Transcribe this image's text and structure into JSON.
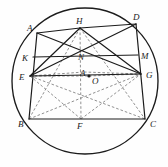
{
  "figure": {
    "type": "euclidean-geometry-diagram",
    "colors": {
      "stroke": "#1b1b1b",
      "dashed": "#7a7a7a",
      "background": "#fefefe",
      "label": "#1b1b1b"
    },
    "circle": {
      "name": "circumcircle",
      "cx": 85,
      "cy": 81,
      "r": 73
    },
    "points": [
      {
        "id": "A",
        "label": "A",
        "x": 37,
        "y": 33,
        "lx": 27,
        "ly": 31
      },
      {
        "id": "B",
        "label": "B",
        "x": 29,
        "y": 119,
        "lx": 18,
        "ly": 127
      },
      {
        "id": "C",
        "label": "C",
        "x": 145,
        "y": 119,
        "lx": 150,
        "ly": 127
      },
      {
        "id": "D",
        "label": "D",
        "x": 136,
        "y": 24,
        "lx": 133,
        "ly": 20
      },
      {
        "id": "E",
        "label": "E",
        "x": 30,
        "y": 76,
        "lx": 19,
        "ly": 80
      },
      {
        "id": "F",
        "label": "F",
        "x": 81,
        "y": 119,
        "lx": 77,
        "ly": 129
      },
      {
        "id": "G",
        "label": "G",
        "x": 141,
        "y": 74,
        "lx": 146,
        "ly": 78
      },
      {
        "id": "H",
        "label": "H",
        "x": 80,
        "y": 28,
        "lx": 76,
        "ly": 24
      },
      {
        "id": "K",
        "label": "K",
        "x": 33,
        "y": 57,
        "lx": 22,
        "ly": 61
      },
      {
        "id": "M",
        "label": "M",
        "x": 138,
        "y": 55,
        "lx": 141,
        "ly": 59
      },
      {
        "id": "N",
        "label": "N",
        "x": 82,
        "y": 62,
        "lx": 78,
        "ly": 60
      },
      {
        "id": "P",
        "label": "A",
        "x": 84,
        "y": 72,
        "lx": 80,
        "ly": 76
      },
      {
        "id": "O",
        "label": "O",
        "x": 89,
        "y": 76,
        "lx": 92,
        "ly": 84
      }
    ],
    "solid_segments": [
      {
        "name": "side-AB",
        "from": "A",
        "to": "B"
      },
      {
        "name": "side-BC",
        "from": "B",
        "to": "C"
      },
      {
        "name": "side-CD",
        "from": "C",
        "to": "D"
      },
      {
        "name": "side-AH",
        "from": "A",
        "to": "H"
      },
      {
        "name": "side-HD",
        "from": "H",
        "to": "D"
      },
      {
        "name": "chord-KM",
        "from": "K",
        "to": "M"
      },
      {
        "name": "chord-EG",
        "from": "E",
        "to": "G"
      },
      {
        "name": "chord-ED",
        "from": "E",
        "to": "D"
      },
      {
        "name": "chord-AG",
        "from": "A",
        "to": "G"
      },
      {
        "name": "chord-EH",
        "from": "E",
        "to": "H"
      },
      {
        "name": "chord-HG",
        "from": "H",
        "to": "G"
      }
    ],
    "dashed_segments": [
      {
        "name": "dashed-HF",
        "from": "H",
        "to": "F"
      },
      {
        "name": "dashed-EF",
        "from": "E",
        "to": "F"
      },
      {
        "name": "dashed-FG",
        "from": "F",
        "to": "G"
      },
      {
        "name": "dashed-EO",
        "from": "E",
        "to": "O"
      },
      {
        "name": "dashed-OG",
        "from": "O",
        "to": "G"
      },
      {
        "name": "dashed-EP",
        "from": "E",
        "to": "P"
      },
      {
        "name": "dashed-PG",
        "from": "P",
        "to": "G"
      },
      {
        "name": "dashed-HB",
        "from": "H",
        "to": "B"
      },
      {
        "name": "dashed-HC",
        "from": "H",
        "to": "C"
      },
      {
        "name": "dashed-EC",
        "from": "E",
        "to": "C"
      },
      {
        "name": "dashed-BG",
        "from": "B",
        "to": "G"
      }
    ],
    "center_dot": {
      "name": "circumcenter-marker",
      "x": 89,
      "y": 76,
      "r": 1.6
    }
  }
}
